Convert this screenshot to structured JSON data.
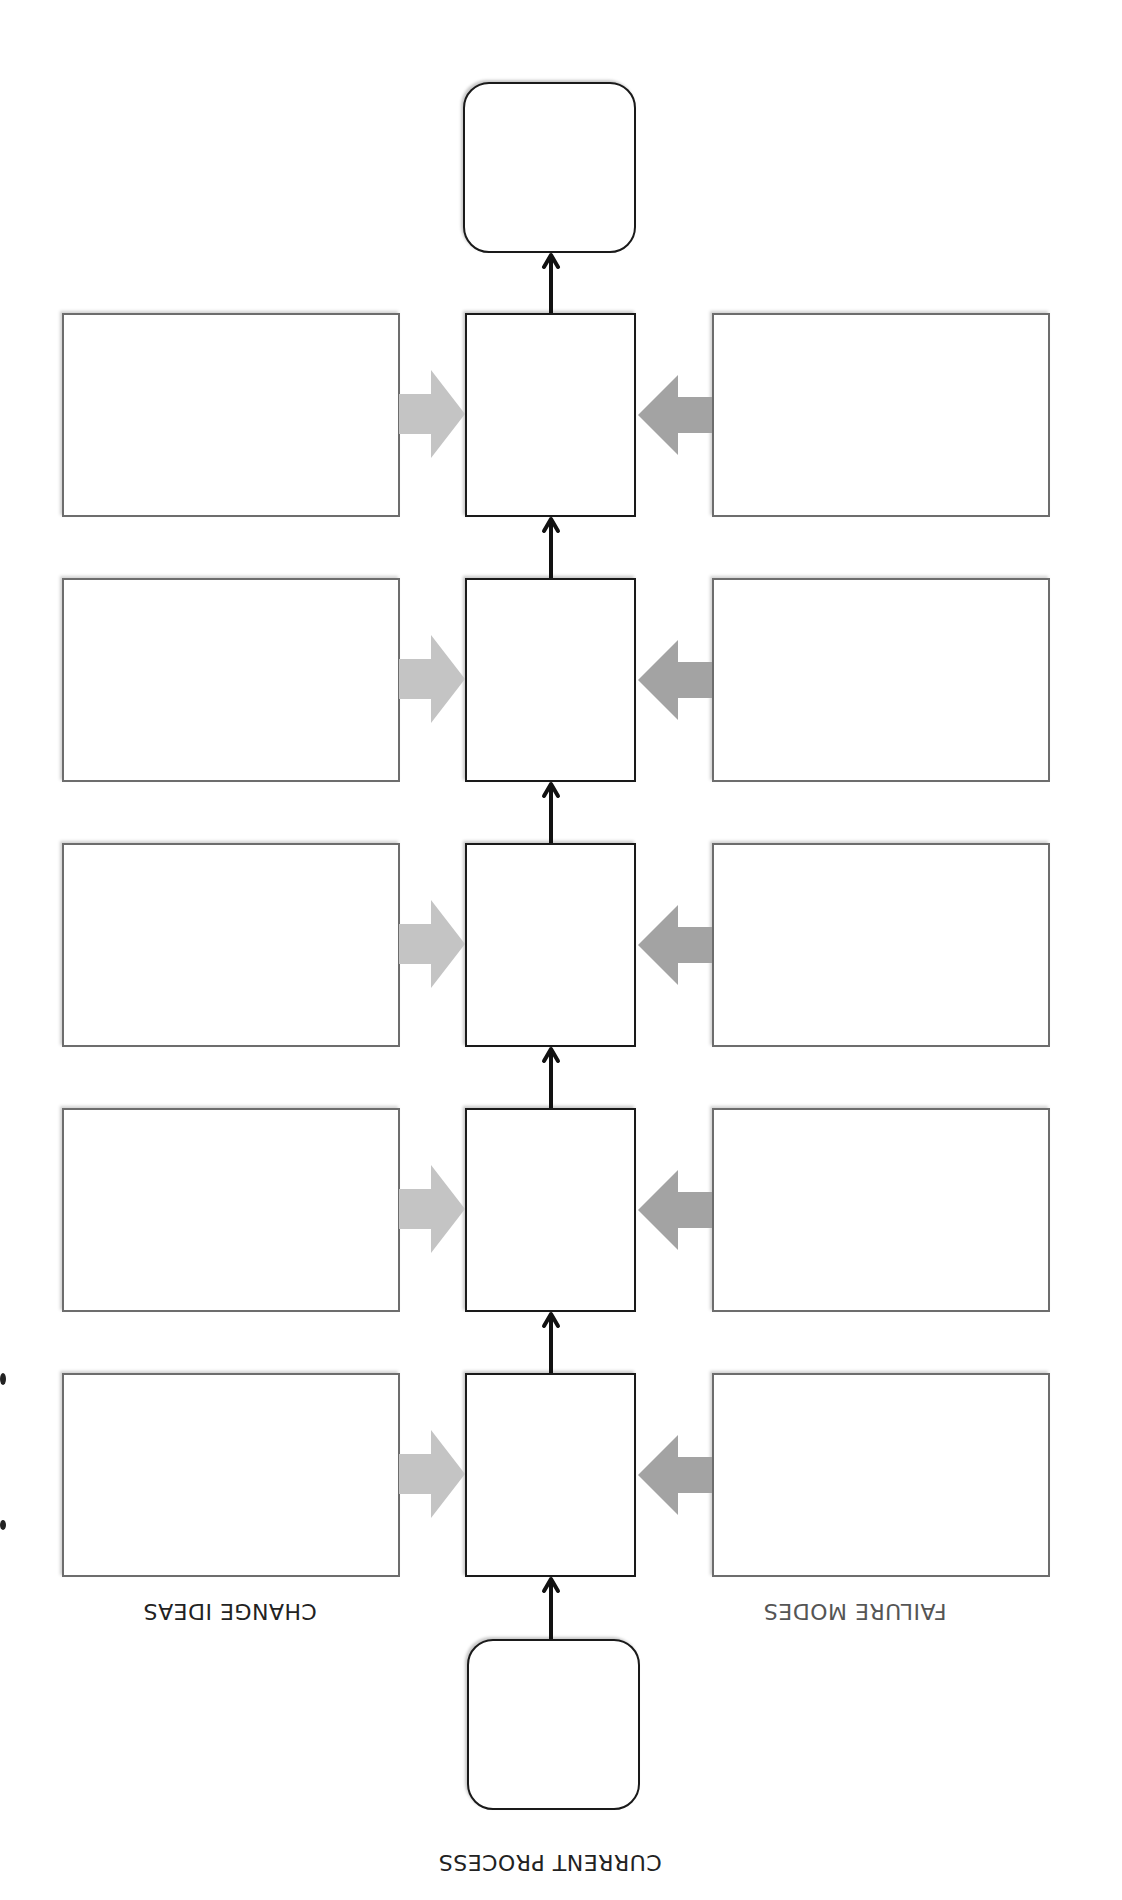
{
  "labels": {
    "current_process": "CURRENT PROCESS",
    "change_ideas": "CHANGE IDEAS",
    "failure_modes": "FAILURE MODES"
  },
  "colors": {
    "step_border": "#1a1a1a",
    "side_border": "#6d6d6d",
    "change_arrow": "#c4c4c4",
    "failure_arrow": "#a3a3a3",
    "label_change": "#222222",
    "label_failure": "#555555",
    "label_process": "#222222"
  },
  "orientation": "rotated-180",
  "process_steps": [
    {
      "step": 1,
      "text": "",
      "change_idea": "",
      "failure_mode": ""
    },
    {
      "step": 2,
      "text": "",
      "change_idea": "",
      "failure_mode": ""
    },
    {
      "step": 3,
      "text": "",
      "change_idea": "",
      "failure_mode": ""
    },
    {
      "step": 4,
      "text": "",
      "change_idea": "",
      "failure_mode": ""
    },
    {
      "step": 5,
      "text": "",
      "change_idea": "",
      "failure_mode": ""
    }
  ],
  "terminals": {
    "start": "",
    "end": ""
  }
}
